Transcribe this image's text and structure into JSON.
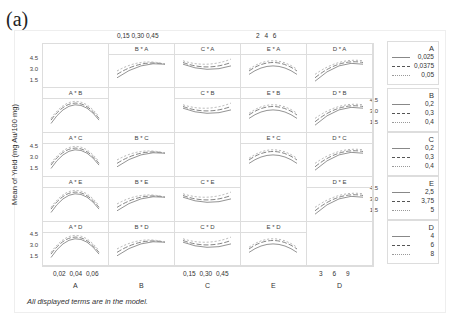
{
  "panel_label": "(a)",
  "footnote": "All displayed terms are in the model.",
  "chart_data": {
    "type": "line",
    "ylabel": "Mean of Yield (mg Au/100 mg)",
    "y_ticks": [
      "4.5",
      "3.0",
      "1.5"
    ],
    "ylim": [
      0.5,
      5.0
    ],
    "factors": [
      "A",
      "B",
      "C",
      "E",
      "D"
    ],
    "x_axes": {
      "A": {
        "ticks": [
          "0,02",
          "0,04",
          "0,06"
        ],
        "range": [
          0.01,
          0.065
        ]
      },
      "B": {
        "ticks": [
          "0,15",
          "0,30",
          "0,45"
        ],
        "range": [
          0.1,
          0.5
        ]
      },
      "C": {
        "ticks": [
          "0,15",
          "0,30",
          "0,45"
        ],
        "range": [
          0.1,
          0.5
        ]
      },
      "E": {
        "ticks": [
          "2",
          "4",
          "6"
        ],
        "range": [
          1,
          7
        ]
      },
      "D": {
        "ticks": [
          "3",
          "6",
          "9"
        ],
        "range": [
          2,
          10
        ]
      }
    },
    "top_tick_labels": {
      "B": "0,15  0,30  0,45",
      "E": "2    4    6"
    },
    "panels": [
      {
        "label": "B * A",
        "row": 0,
        "col": 1
      },
      {
        "label": "C * A",
        "row": 0,
        "col": 2
      },
      {
        "label": "E * A",
        "row": 0,
        "col": 3
      },
      {
        "label": "D * A",
        "row": 0,
        "col": 4
      },
      {
        "label": "A * B",
        "row": 1,
        "col": 0
      },
      {
        "label": "C * B",
        "row": 1,
        "col": 2
      },
      {
        "label": "E * B",
        "row": 1,
        "col": 3
      },
      {
        "label": "D * B",
        "row": 1,
        "col": 4
      },
      {
        "label": "A * C",
        "row": 2,
        "col": 0
      },
      {
        "label": "B * C",
        "row": 2,
        "col": 1
      },
      {
        "label": "E * C",
        "row": 2,
        "col": 3
      },
      {
        "label": "D * C",
        "row": 2,
        "col": 4
      },
      {
        "label": "A * E",
        "row": 3,
        "col": 0
      },
      {
        "label": "B * E",
        "row": 3,
        "col": 1
      },
      {
        "label": "C * E",
        "row": 3,
        "col": 2
      },
      {
        "label": "D * E",
        "row": 3,
        "col": 4
      },
      {
        "label": "A * D",
        "row": 4,
        "col": 0
      },
      {
        "label": "B * D",
        "row": 4,
        "col": 1
      },
      {
        "label": "C * D",
        "row": 4,
        "col": 2
      },
      {
        "label": "E * D",
        "row": 4,
        "col": 3
      }
    ],
    "legends": [
      {
        "factor": "A",
        "levels": [
          "0,025",
          "0,0375",
          "0,05"
        ]
      },
      {
        "factor": "B",
        "levels": [
          "0,2",
          "0,3",
          "0,4"
        ]
      },
      {
        "factor": "C",
        "levels": [
          "0,2",
          "0,3",
          "0,4"
        ]
      },
      {
        "factor": "E",
        "levels": [
          "2,5",
          "3,75",
          "5"
        ]
      },
      {
        "factor": "D",
        "levels": [
          "4",
          "6",
          "8"
        ]
      }
    ],
    "line_styles": [
      "solid",
      "long-dash",
      "short-dash"
    ],
    "grid": false,
    "legend_position": "right"
  }
}
